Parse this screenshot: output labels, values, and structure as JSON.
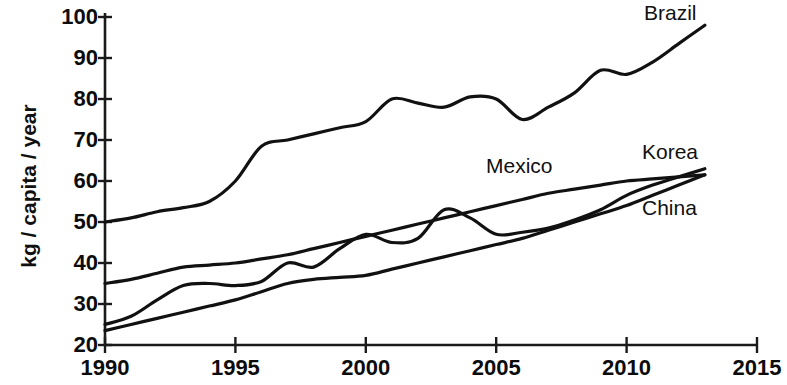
{
  "chart_data": {
    "type": "line",
    "title": "",
    "xlabel": "",
    "ylabel": "kg / capita / year",
    "xlim": [
      1990,
      2015
    ],
    "ylim": [
      20,
      100
    ],
    "grid": false,
    "legend_position": "inline-right",
    "xticks": [
      "1990",
      "1995",
      "2000",
      "2005",
      "2010",
      "2015"
    ],
    "yticks": [
      "20",
      "30",
      "40",
      "50",
      "60",
      "70",
      "80",
      "90",
      "100"
    ],
    "x": [
      1990,
      1991,
      1992,
      1993,
      1994,
      1995,
      1996,
      1997,
      1998,
      1999,
      2000,
      2001,
      2002,
      2003,
      2004,
      2005,
      2006,
      2007,
      2008,
      2009,
      2010,
      2011,
      2012,
      2013
    ],
    "series": [
      {
        "name": "Brazil",
        "values": [
          50,
          51,
          52.5,
          53.5,
          55,
          60,
          68.5,
          70,
          71.5,
          73,
          74.5,
          80,
          79,
          78,
          80.5,
          80,
          75,
          78,
          81.5,
          87,
          86,
          89,
          93.5,
          98
        ]
      },
      {
        "name": "Mexico",
        "values": [
          35,
          36,
          37.5,
          39,
          39.5,
          40,
          41,
          42,
          43.5,
          45,
          46.5,
          48,
          49.5,
          51,
          52.5,
          54,
          55.5,
          57,
          58,
          59,
          60,
          60.5,
          61,
          61.5
        ]
      },
      {
        "name": "Korea",
        "values": [
          25,
          27,
          31,
          34.5,
          35,
          34.5,
          35.5,
          40,
          39,
          43.5,
          47,
          45,
          46,
          53,
          51,
          47,
          47.5,
          48.5,
          50.5,
          53,
          56.5,
          59,
          61,
          63
        ]
      },
      {
        "name": "China",
        "values": [
          23.5,
          25,
          26.5,
          28,
          29.5,
          31,
          33,
          35,
          36,
          36.5,
          37,
          38.5,
          40,
          41.5,
          43,
          44.5,
          46,
          48,
          50,
          52,
          54,
          56.5,
          59,
          61.5
        ]
      }
    ]
  },
  "axis": {
    "y_label": "kg / capita / year"
  },
  "labels": {
    "brazil": "Brazil",
    "mexico": "Mexico",
    "korea": "Korea",
    "china": "China"
  },
  "colors": {
    "line": "#111111",
    "axis": "#1a1a1a",
    "text": "#0c0c0c",
    "background": "#ffffff"
  }
}
